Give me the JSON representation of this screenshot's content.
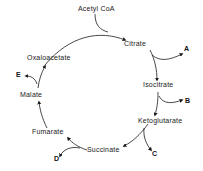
{
  "diagram": {
    "title": "",
    "type": "cycle",
    "input": "Acetyl CoA",
    "nodes": [
      "Citrate",
      "Isocitrate",
      "Ketoglutarate",
      "Succinate",
      "Fumarate",
      "Malate",
      "Oxaloacetate"
    ],
    "outputs": {
      "A": "A",
      "B": "B",
      "C": "C",
      "D": "D",
      "E": "E"
    }
  }
}
